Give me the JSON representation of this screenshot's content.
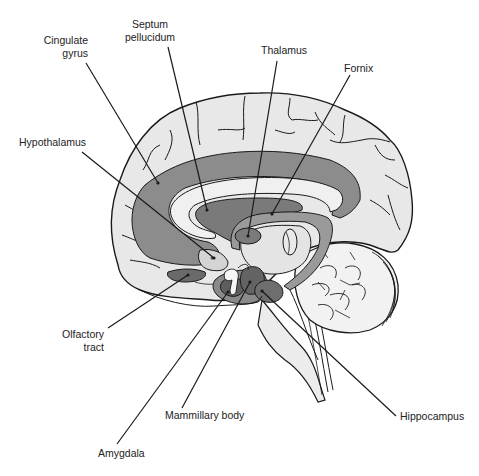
{
  "diagram": {
    "type": "anatomical",
    "colors": {
      "cortex": "#e6e6e6",
      "limbic_dark": "#8a8a8a",
      "limbic_mid": "#b0b0b0",
      "structure_dark": "#6d6d6d",
      "outline": "#1a1a1a",
      "background": "#ffffff"
    },
    "labels": [
      {
        "id": "cingulate-gyrus",
        "line1": "Cingulate",
        "line2": "gyrus"
      },
      {
        "id": "septum-pellucidum",
        "line1": "Septum",
        "line2": "pellucidum"
      },
      {
        "id": "thalamus",
        "line1": "Thalamus"
      },
      {
        "id": "fornix",
        "line1": "Fornix"
      },
      {
        "id": "hypothalamus",
        "line1": "Hypothalamus"
      },
      {
        "id": "olfactory-tract",
        "line1": "Olfactory",
        "line2": "tract"
      },
      {
        "id": "mammillary-body",
        "line1": "Mammillary body"
      },
      {
        "id": "hippocampus",
        "line1": "Hippocampus"
      },
      {
        "id": "amygdala",
        "line1": "Amygdala"
      }
    ]
  }
}
